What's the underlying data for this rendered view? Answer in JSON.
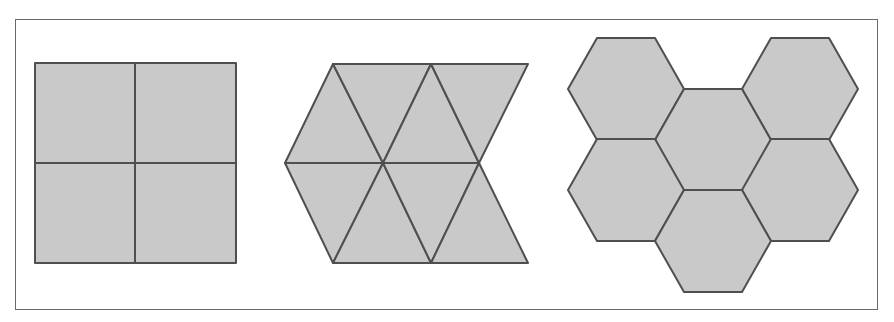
{
  "figure": {
    "tile_fill": "#c9c9c9",
    "tile_stroke": "#4f4f4f",
    "panels": [
      {
        "name": "square-tiling",
        "shape": "square",
        "tile_count": 4,
        "arrangement": "2x2 grid"
      },
      {
        "name": "triangle-tiling",
        "shape": "equilateral-triangle",
        "tile_count": 8,
        "arrangement": "two rows of four alternating triangles"
      },
      {
        "name": "hexagon-tiling",
        "shape": "regular-hexagon",
        "tile_count": 6,
        "arrangement": "honeycomb cluster"
      }
    ]
  }
}
